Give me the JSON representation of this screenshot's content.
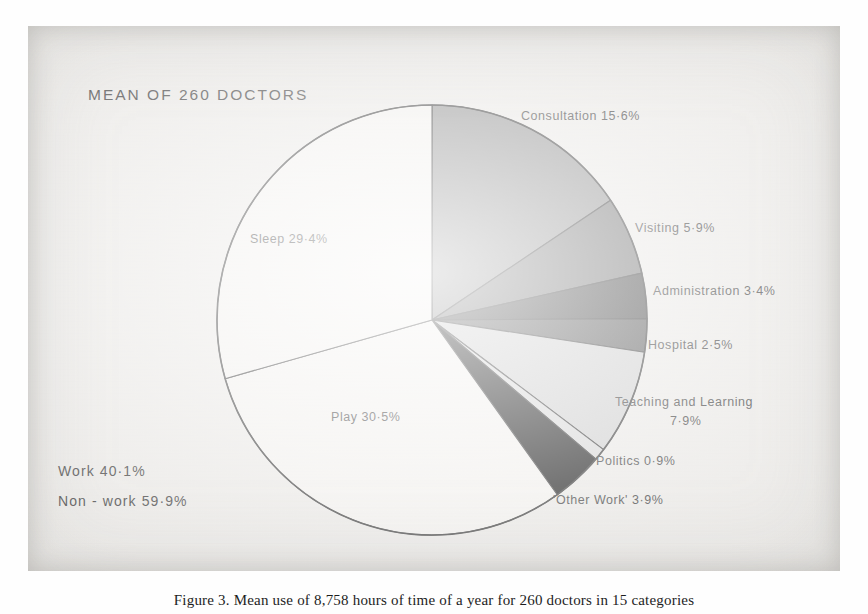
{
  "page": {
    "title": "MEAN OF 260 DOCTORS",
    "caption": "Figure 3. Mean use of 8,758 hours of time of a year for 260 doctors in 15 categories"
  },
  "chart_data": {
    "type": "pie",
    "title": "MEAN OF 260 DOCTORS",
    "xlabel": "",
    "ylabel": "",
    "units": "percent",
    "start_angle_deg": 0,
    "direction": "clockwise",
    "legend_position": "callout-labels",
    "grid": false,
    "categories": [
      "Consultation",
      "Visiting",
      "Administration",
      "Hospital",
      "Teaching and Learning",
      "Politics",
      "'Other Work'",
      "Play",
      "Sleep"
    ],
    "values": [
      15.6,
      5.9,
      3.4,
      2.5,
      7.9,
      0.9,
      3.9,
      30.5,
      29.4
    ],
    "colors": [
      "#8c8c8c",
      "#6d6d6d",
      "#3a3a3a",
      "#4f4f4f",
      "#cdcdcd",
      "#d6d6d6",
      "#0d0d0d",
      "#f4f2ef",
      "#f4f2ef"
    ],
    "slices": [
      {
        "name": "Consultation",
        "value": 15.6,
        "label": "Consultation 15·6%",
        "color": "#8c8c8c"
      },
      {
        "name": "Visiting",
        "value": 5.9,
        "label": "Visiting 5·9%",
        "color": "#6d6d6d"
      },
      {
        "name": "Administration",
        "value": 3.4,
        "label": "Administration 3·4%",
        "color": "#3a3a3a"
      },
      {
        "name": "Hospital",
        "value": 2.5,
        "label": "Hospital 2·5%",
        "color": "#4f4f4f"
      },
      {
        "name": "Teaching and Learning",
        "value": 7.9,
        "label": "Teaching and Learning",
        "label2": "7·9%",
        "color": "#cdcdcd"
      },
      {
        "name": "Politics",
        "value": 0.9,
        "label": "Politics 0·9%",
        "color": "#d6d6d6"
      },
      {
        "name": "Other Work",
        "value": 3.9,
        "label": "'Other Work' 3·9%",
        "color": "#0d0d0d"
      },
      {
        "name": "Play",
        "value": 30.5,
        "label": "Play 30·5%",
        "color": "#f4f2ef"
      },
      {
        "name": "Sleep",
        "value": 29.4,
        "label": "Sleep 29·4%",
        "color": "#f4f2ef"
      }
    ],
    "summary": [
      {
        "name": "Work",
        "value": 40.1,
        "label": "Work   40·1%"
      },
      {
        "name": "Non-work",
        "value": 59.9,
        "label": "Non - work   59·9%"
      }
    ]
  }
}
